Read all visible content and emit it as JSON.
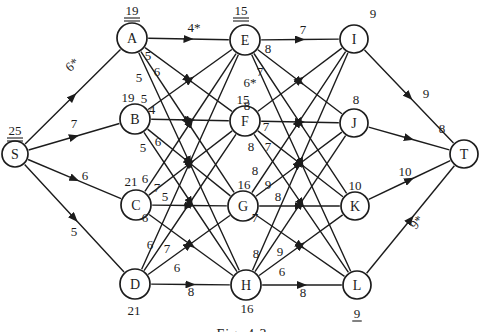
{
  "figure": {
    "caption": "Fig. 4.3"
  },
  "styles": {
    "ink": "#1c1c1c",
    "background": "#ffffff"
  },
  "nodes": [
    {
      "id": "S",
      "label": "S",
      "x": 15,
      "y": 154,
      "r": 13,
      "value": "25",
      "vx": 15,
      "vy": 135,
      "underline": "double"
    },
    {
      "id": "A",
      "label": "A",
      "x": 132,
      "y": 38,
      "r": 15,
      "value": "19",
      "vx": 132,
      "vy": 15,
      "underline": "double"
    },
    {
      "id": "B",
      "label": "B",
      "x": 135,
      "y": 119,
      "r": 15,
      "value": "19",
      "vx": 128,
      "vy": 102,
      "underline": "none"
    },
    {
      "id": "C",
      "label": "C",
      "x": 136,
      "y": 205,
      "r": 15,
      "value": "21",
      "vx": 131,
      "vy": 186,
      "underline": "none"
    },
    {
      "id": "D",
      "label": "D",
      "x": 135,
      "y": 284,
      "r": 15,
      "value": "21",
      "vx": 134,
      "vy": 315,
      "underline": "none"
    },
    {
      "id": "E",
      "label": "E",
      "x": 245,
      "y": 40,
      "r": 15,
      "value": "15",
      "vx": 241,
      "vy": 15,
      "underline": "double"
    },
    {
      "id": "F",
      "label": "F",
      "x": 245,
      "y": 121,
      "r": 15,
      "value": "15",
      "vx": 243,
      "vy": 104,
      "underline": "none"
    },
    {
      "id": "G",
      "label": "G",
      "x": 243,
      "y": 206,
      "r": 15,
      "value": "16",
      "vx": 244,
      "vy": 189,
      "underline": "none"
    },
    {
      "id": "H",
      "label": "H",
      "x": 246,
      "y": 285,
      "r": 15,
      "value": "16",
      "vx": 247,
      "vy": 313,
      "underline": "none"
    },
    {
      "id": "I",
      "label": "I",
      "x": 354,
      "y": 39,
      "r": 14,
      "value": "9",
      "vx": 373,
      "vy": 18,
      "underline": "none"
    },
    {
      "id": "J",
      "label": "J",
      "x": 354,
      "y": 123,
      "r": 14,
      "value": "8",
      "vx": 356,
      "vy": 104,
      "underline": "none"
    },
    {
      "id": "K",
      "label": "K",
      "x": 355,
      "y": 206,
      "r": 14,
      "value": "10",
      "vx": 355,
      "vy": 190,
      "underline": "none"
    },
    {
      "id": "L",
      "label": "L",
      "x": 357,
      "y": 285,
      "r": 14,
      "value": "9",
      "vx": 357,
      "vy": 318,
      "underline": "single"
    },
    {
      "id": "T",
      "label": "T",
      "x": 464,
      "y": 154,
      "r": 14,
      "value": "",
      "vx": 0,
      "vy": 0,
      "underline": "none"
    }
  ],
  "edges": [
    {
      "from": "S",
      "to": "A",
      "label": "6*",
      "lx": 75,
      "ly": 68,
      "rot": -41
    },
    {
      "from": "S",
      "to": "B",
      "label": "7",
      "lx": 74,
      "ly": 128,
      "rot": 0
    },
    {
      "from": "S",
      "to": "C",
      "label": "6",
      "lx": 85,
      "ly": 180,
      "rot": 0
    },
    {
      "from": "S",
      "to": "D",
      "label": "5",
      "lx": 74,
      "ly": 236,
      "rot": 0
    },
    {
      "from": "A",
      "to": "E",
      "label": "4*",
      "lx": 194,
      "ly": 32,
      "rot": 0
    },
    {
      "from": "A",
      "to": "F",
      "label": "5",
      "lx": 148,
      "ly": 60,
      "rot": 0
    },
    {
      "from": "A",
      "to": "G",
      "label": "6",
      "lx": 157,
      "ly": 76,
      "rot": 0
    },
    {
      "from": "A",
      "to": "H",
      "label": "5",
      "lx": 139,
      "ly": 82,
      "rot": 0
    },
    {
      "from": "B",
      "to": "E",
      "label": "5",
      "lx": 144,
      "ly": 103,
      "rot": 0
    },
    {
      "from": "B",
      "to": "F",
      "label": "4",
      "lx": 152,
      "ly": 114,
      "rot": 0
    },
    {
      "from": "B",
      "to": "G",
      "label": "6",
      "lx": 158,
      "ly": 146,
      "rot": 0
    },
    {
      "from": "B",
      "to": "H",
      "label": "5",
      "lx": 143,
      "ly": 152,
      "rot": 0
    },
    {
      "from": "C",
      "to": "E",
      "label": "6",
      "lx": 145,
      "ly": 183,
      "rot": 0
    },
    {
      "from": "C",
      "to": "F",
      "label": "7",
      "lx": 157,
      "ly": 192,
      "rot": 0
    },
    {
      "from": "C",
      "to": "G",
      "label": "5",
      "lx": 165,
      "ly": 201,
      "rot": 0
    },
    {
      "from": "C",
      "to": "H",
      "label": "6",
      "lx": 145,
      "ly": 222,
      "rot": 0
    },
    {
      "from": "D",
      "to": "E",
      "label": "6",
      "lx": 150,
      "ly": 249,
      "rot": 0
    },
    {
      "from": "D",
      "to": "F",
      "label": "7",
      "lx": 167,
      "ly": 253,
      "rot": 0
    },
    {
      "from": "D",
      "to": "G",
      "label": "6",
      "lx": 177,
      "ly": 272,
      "rot": 0
    },
    {
      "from": "D",
      "to": "H",
      "label": "8",
      "lx": 191,
      "ly": 296,
      "rot": 0
    },
    {
      "from": "E",
      "to": "I",
      "label": "7",
      "lx": 303,
      "ly": 34,
      "rot": 0
    },
    {
      "from": "E",
      "to": "J",
      "label": "8",
      "lx": 268,
      "ly": 53,
      "rot": 0
    },
    {
      "from": "E",
      "to": "K",
      "label": "7",
      "lx": 260,
      "ly": 76,
      "rot": 0
    },
    {
      "from": "E",
      "to": "L",
      "label": "6*",
      "lx": 250,
      "ly": 87,
      "rot": 0
    },
    {
      "from": "F",
      "to": "I",
      "label": "8",
      "lx": 247,
      "ly": 110,
      "rot": 0
    },
    {
      "from": "F",
      "to": "J",
      "label": "7",
      "lx": 266,
      "ly": 131,
      "rot": 0
    },
    {
      "from": "F",
      "to": "K",
      "label": "7",
      "lx": 268,
      "ly": 151,
      "rot": 0
    },
    {
      "from": "F",
      "to": "L",
      "label": "8",
      "lx": 251,
      "ly": 151,
      "rot": 0
    },
    {
      "from": "G",
      "to": "I",
      "label": "8",
      "lx": 255,
      "ly": 175,
      "rot": 0
    },
    {
      "from": "G",
      "to": "J",
      "label": "9",
      "lx": 268,
      "ly": 189,
      "rot": 0
    },
    {
      "from": "G",
      "to": "K",
      "label": "8",
      "lx": 278,
      "ly": 201,
      "rot": 0
    },
    {
      "from": "G",
      "to": "L",
      "label": "7",
      "lx": 255,
      "ly": 222,
      "rot": 0
    },
    {
      "from": "H",
      "to": "I",
      "label": "8",
      "lx": 256,
      "ly": 258,
      "rot": 0
    },
    {
      "from": "H",
      "to": "J",
      "label": "9",
      "lx": 280,
      "ly": 256,
      "rot": 0
    },
    {
      "from": "H",
      "to": "K",
      "label": "6",
      "lx": 282,
      "ly": 276,
      "rot": 0
    },
    {
      "from": "H",
      "to": "L",
      "label": "8",
      "lx": 303,
      "ly": 297,
      "rot": 0
    },
    {
      "from": "I",
      "to": "T",
      "label": "9",
      "lx": 426,
      "ly": 98,
      "rot": 0
    },
    {
      "from": "J",
      "to": "T",
      "label": "8",
      "lx": 442,
      "ly": 133,
      "rot": 0
    },
    {
      "from": "K",
      "to": "T",
      "label": "10",
      "lx": 405,
      "ly": 176,
      "rot": 0
    },
    {
      "from": "L",
      "to": "T",
      "label": "9*",
      "lx": 420,
      "ly": 225,
      "rot": -50
    }
  ]
}
